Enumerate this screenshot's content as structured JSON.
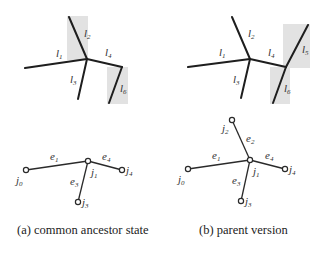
{
  "figure": {
    "panels": [
      {
        "id": "a",
        "caption": "(a) common ancestor state",
        "lines": [
          {
            "name": "l",
            "sub": "1"
          },
          {
            "name": "l",
            "sub": "2"
          },
          {
            "name": "l",
            "sub": "3"
          },
          {
            "name": "l",
            "sub": "4"
          },
          {
            "name": "l",
            "sub": "6"
          }
        ],
        "highlighted_lines": [
          "l2",
          "l6"
        ],
        "graph": {
          "nodes": [
            {
              "name": "j",
              "sub": "0"
            },
            {
              "name": "j",
              "sub": "1"
            },
            {
              "name": "j",
              "sub": "3"
            },
            {
              "name": "j",
              "sub": "4"
            }
          ],
          "edges": [
            {
              "name": "e",
              "sub": "1",
              "from": "j0",
              "to": "j1"
            },
            {
              "name": "e",
              "sub": "3",
              "from": "j1",
              "to": "j3"
            },
            {
              "name": "e",
              "sub": "4",
              "from": "j1",
              "to": "j4"
            }
          ]
        }
      },
      {
        "id": "b",
        "caption": "(b) parent version",
        "lines": [
          {
            "name": "l",
            "sub": "1"
          },
          {
            "name": "l",
            "sub": "2"
          },
          {
            "name": "l",
            "sub": "3"
          },
          {
            "name": "l",
            "sub": "4"
          },
          {
            "name": "l",
            "sub": "5"
          },
          {
            "name": "l",
            "sub": "6"
          }
        ],
        "highlighted_lines": [
          "l5",
          "l6"
        ],
        "graph": {
          "nodes": [
            {
              "name": "j",
              "sub": "0"
            },
            {
              "name": "j",
              "sub": "1"
            },
            {
              "name": "j",
              "sub": "2"
            },
            {
              "name": "j",
              "sub": "3"
            },
            {
              "name": "j",
              "sub": "4"
            }
          ],
          "edges": [
            {
              "name": "e",
              "sub": "1",
              "from": "j0",
              "to": "j1"
            },
            {
              "name": "e",
              "sub": "2",
              "from": "j2",
              "to": "j1"
            },
            {
              "name": "e",
              "sub": "3",
              "from": "j1",
              "to": "j3"
            },
            {
              "name": "e",
              "sub": "4",
              "from": "j1",
              "to": "j4"
            }
          ]
        }
      }
    ]
  }
}
